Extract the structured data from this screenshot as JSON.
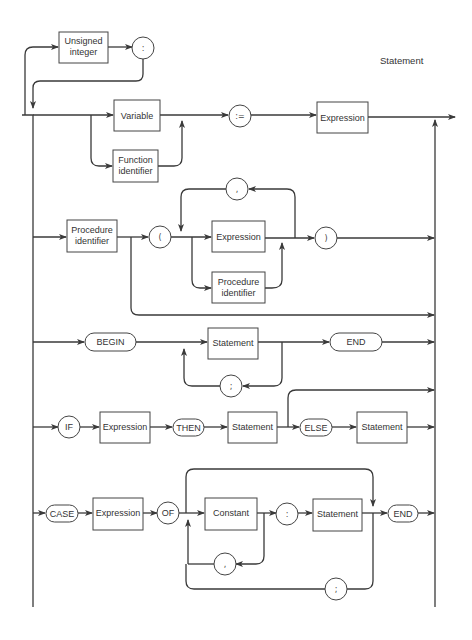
{
  "diagram": {
    "title": "Statement",
    "label_prefix": {
      "unsigned_integer": [
        "Unsigned",
        "integer"
      ],
      "colon": ":"
    },
    "assignment_row": {
      "variable": "Variable",
      "function_identifier": [
        "Function",
        "identifier"
      ],
      "assign_op": ":=",
      "expression": "Expression"
    },
    "procedure_row": {
      "procedure_identifier": [
        "Procedure",
        "identifier"
      ],
      "open_paren": "(",
      "comma": ",",
      "expression": "Expression",
      "param_procedure_identifier": [
        "Procedure",
        "identifier"
      ],
      "close_paren": ")"
    },
    "compound_row": {
      "begin": "BEGIN",
      "statement": "Statement",
      "semicolon": ";",
      "end": "END"
    },
    "if_row": {
      "if": "IF",
      "expression": "Expression",
      "then": "THEN",
      "statement": "Statement",
      "else": "ELSE",
      "else_statement": "Statement"
    },
    "case_row": {
      "case": "CASE",
      "expression": "Expression",
      "of": "OF",
      "constant": "Constant",
      "colon": ":",
      "statement": "Statement",
      "comma": ",",
      "semicolon": ";",
      "end": "END"
    }
  }
}
